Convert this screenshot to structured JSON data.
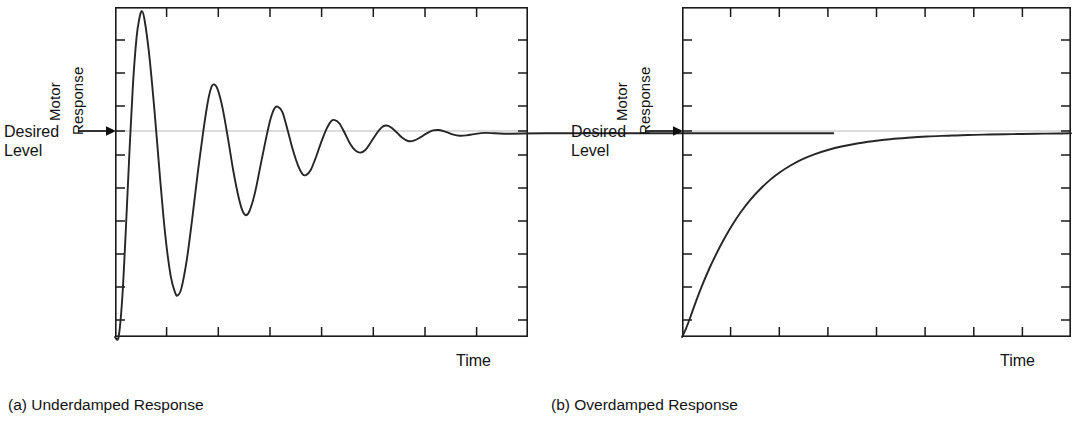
{
  "figure": {
    "background_color": "#ffffff",
    "line_color": "#262626",
    "level_line_color": "#b9b9b9"
  },
  "panels": [
    {
      "id": "a",
      "caption": "(a) Underdamped Response",
      "ylabel_line1": "Motor",
      "ylabel_line2": "Response",
      "level_label_line1": "Desired",
      "level_label_line2": "Level",
      "xlabel": "Time"
    },
    {
      "id": "b",
      "caption": "(b) Overdamped Response",
      "ylabel_line1": "Motor",
      "ylabel_line2": "Response",
      "level_label_line1": "Desired",
      "level_label_line2": "Level",
      "xlabel": "Time"
    }
  ],
  "chart_data": [
    {
      "type": "line",
      "id": "underdamped-response",
      "title": "(a) Underdamped Response",
      "xlabel": "Time",
      "ylabel": "Motor Response",
      "grid": false,
      "legend": null,
      "axis_ticks_labeled": false,
      "xlim": [
        0,
        1
      ],
      "ylim": [
        0,
        1.62
      ],
      "annotations": [
        {
          "text": "Desired Level",
          "y": 1.0,
          "arrow": true,
          "position": "left-of-axis"
        }
      ],
      "reference_lines": [
        {
          "name": "desired-level",
          "y": 1.0,
          "color": "#b9b9b9"
        }
      ],
      "x_tick_count": 7,
      "y_tick_count": 9,
      "description": "Second-order step response with zeta about 0.12; overshoots well above desired level, rings down through decaying oscillations and settles on the desired level.",
      "model": {
        "form": "1 - exp(-z*wn*t)/sqrt(1-z^2) * sin(wd*t + phi)",
        "zeta": 0.12,
        "wn": 38.0,
        "t0": 0.01
      },
      "series": [
        {
          "name": "motor response",
          "points": [
            [
              0.0,
              0.0
            ],
            [
              0.01,
              0.0
            ],
            [
              0.02,
              0.185
            ],
            [
              0.03,
              0.52
            ],
            [
              0.04,
              0.9
            ],
            [
              0.05,
              1.24
            ],
            [
              0.06,
              1.47
            ],
            [
              0.068,
              1.565
            ],
            [
              0.075,
              1.6
            ],
            [
              0.082,
              1.56
            ],
            [
              0.095,
              1.39
            ],
            [
              0.11,
              1.11
            ],
            [
              0.125,
              0.79
            ],
            [
              0.14,
              0.5
            ],
            [
              0.155,
              0.3
            ],
            [
              0.168,
              0.215
            ],
            [
              0.175,
              0.205
            ],
            [
              0.185,
              0.24
            ],
            [
              0.2,
              0.38
            ],
            [
              0.215,
              0.58
            ],
            [
              0.23,
              0.8
            ],
            [
              0.245,
              1.0
            ],
            [
              0.258,
              1.15
            ],
            [
              0.268,
              1.225
            ],
            [
              0.276,
              1.24
            ],
            [
              0.286,
              1.215
            ],
            [
              0.3,
              1.12
            ],
            [
              0.315,
              0.97
            ],
            [
              0.33,
              0.81
            ],
            [
              0.345,
              0.68
            ],
            [
              0.356,
              0.615
            ],
            [
              0.365,
              0.598
            ],
            [
              0.375,
              0.62
            ],
            [
              0.39,
              0.71
            ],
            [
              0.405,
              0.84
            ],
            [
              0.42,
              0.97
            ],
            [
              0.433,
              1.07
            ],
            [
              0.444,
              1.122
            ],
            [
              0.454,
              1.13
            ],
            [
              0.466,
              1.105
            ],
            [
              0.48,
              1.02
            ],
            [
              0.495,
              0.92
            ],
            [
              0.51,
              0.84
            ],
            [
              0.522,
              0.8
            ],
            [
              0.532,
              0.795
            ],
            [
              0.545,
              0.82
            ],
            [
              0.56,
              0.885
            ],
            [
              0.575,
              0.96
            ],
            [
              0.59,
              1.025
            ],
            [
              0.602,
              1.06
            ],
            [
              0.612,
              1.065
            ],
            [
              0.625,
              1.048
            ],
            [
              0.64,
              1.0
            ],
            [
              0.655,
              0.948
            ],
            [
              0.67,
              0.915
            ],
            [
              0.683,
              0.905
            ],
            [
              0.697,
              0.918
            ],
            [
              0.712,
              0.955
            ],
            [
              0.728,
              0.998
            ],
            [
              0.742,
              1.028
            ],
            [
              0.754,
              1.038
            ],
            [
              0.768,
              1.03
            ],
            [
              0.784,
              1.005
            ],
            [
              0.8,
              0.978
            ],
            [
              0.816,
              0.962
            ],
            [
              0.832,
              0.964
            ],
            [
              0.85,
              0.98
            ],
            [
              0.868,
              1.0
            ],
            [
              0.886,
              1.014
            ],
            [
              0.902,
              1.016
            ],
            [
              0.92,
              1.008
            ],
            [
              0.94,
              0.995
            ],
            [
              0.96,
              0.988
            ],
            [
              0.98,
              0.99
            ],
            [
              1.0,
              0.996
            ],
            [
              1.03,
              1.002
            ],
            [
              1.06,
              1.0
            ],
            [
              1.1,
              0.998
            ],
            [
              1.2,
              1.0
            ],
            [
              1.4,
              1.0
            ],
            [
              1.7,
              1.0
            ],
            [
              2.0,
              1.0
            ]
          ]
        }
      ]
    },
    {
      "type": "line",
      "id": "overdamped-response",
      "title": "(b) Overdamped Response",
      "xlabel": "Time",
      "ylabel": "Motor Response",
      "grid": false,
      "legend": null,
      "axis_ticks_labeled": false,
      "xlim": [
        0,
        1
      ],
      "ylim": [
        0,
        1.62
      ],
      "annotations": [
        {
          "text": "Desired Level",
          "y": 1.0,
          "arrow": true,
          "position": "left-of-axis"
        }
      ],
      "reference_lines": [
        {
          "name": "desired-level",
          "y": 1.0,
          "color": "#b9b9b9"
        }
      ],
      "x_tick_count": 7,
      "y_tick_count": 9,
      "description": "Overdamped first/second-order step response rising smoothly from zero with no overshoot, asymptotically approaching the desired level.",
      "model": {
        "form": "1 - exp(-t/tau)",
        "tau": 0.21
      },
      "series": [
        {
          "name": "motor response",
          "points": [
            [
              0.0,
              0.0
            ],
            [
              0.01,
              0.04
            ],
            [
              0.02,
              0.09
            ],
            [
              0.035,
              0.17
            ],
            [
              0.05,
              0.245
            ],
            [
              0.07,
              0.335
            ],
            [
              0.09,
              0.415
            ],
            [
              0.11,
              0.487
            ],
            [
              0.13,
              0.552
            ],
            [
              0.15,
              0.61
            ],
            [
              0.175,
              0.672
            ],
            [
              0.2,
              0.724
            ],
            [
              0.225,
              0.769
            ],
            [
              0.25,
              0.806
            ],
            [
              0.28,
              0.843
            ],
            [
              0.31,
              0.873
            ],
            [
              0.34,
              0.897
            ],
            [
              0.375,
              0.918
            ],
            [
              0.41,
              0.935
            ],
            [
              0.45,
              0.95
            ],
            [
              0.49,
              0.961
            ],
            [
              0.535,
              0.971
            ],
            [
              0.58,
              0.978
            ],
            [
              0.63,
              0.984
            ],
            [
              0.68,
              0.988
            ],
            [
              0.735,
              0.992
            ],
            [
              0.79,
              0.994
            ],
            [
              0.85,
              0.996
            ],
            [
              0.91,
              0.998
            ],
            [
              0.97,
              0.999
            ],
            [
              1.0,
              1.0
            ]
          ]
        }
      ]
    }
  ]
}
